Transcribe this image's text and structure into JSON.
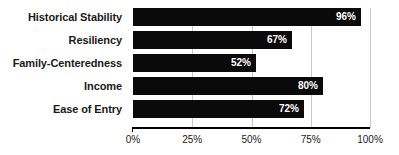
{
  "chart_data": {
    "type": "bar",
    "orientation": "horizontal",
    "title": "",
    "xlabel": "",
    "ylabel": "",
    "categories": [
      "Historical Stability",
      "Resiliency",
      "Family-Centeredness",
      "Income",
      "Ease of Entry"
    ],
    "values": [
      96,
      67,
      52,
      80,
      72
    ],
    "value_labels": [
      "96%",
      "67%",
      "52%",
      "80%",
      "72%"
    ],
    "xlim": [
      0,
      100
    ],
    "xticks": [
      0,
      25,
      50,
      75,
      100
    ],
    "xtick_labels": [
      "0%",
      "25%",
      "50%",
      "75%",
      "100%"
    ],
    "grid": true,
    "legend": false,
    "bar_color": "#0a0a0a",
    "value_label_color": "#ffffff",
    "gridline_color": "#c8c8c8",
    "axis_color": "#000000",
    "background_color": "#ffffff"
  }
}
